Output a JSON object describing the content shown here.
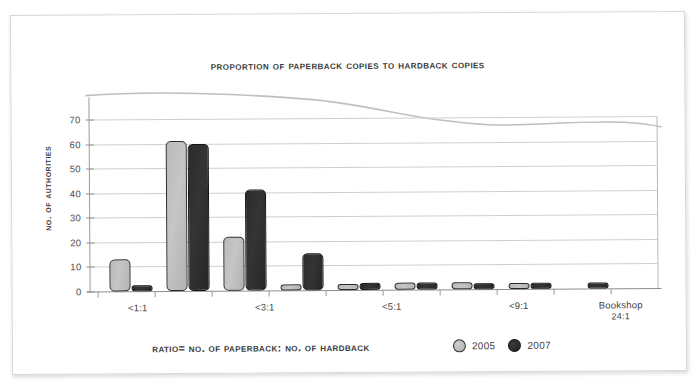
{
  "chart_data": {
    "type": "bar",
    "title": "Proportion of paperback copies to hardback copies",
    "xlabel": "Ratio= no. of paperback: no. of hardback",
    "ylabel": "No. of authorities",
    "categories": [
      "<1:1",
      "",
      "<3:1",
      "",
      "<5:1",
      "",
      "<9:1",
      "",
      "Bookshop 24:1"
    ],
    "tick_labels": [
      {
        "main": "<1:1",
        "sub": ""
      },
      {
        "main": "<3:1",
        "sub": ""
      },
      {
        "main": "<5:1",
        "sub": ""
      },
      {
        "main": "<9:1",
        "sub": ""
      },
      {
        "main": "Bookshop",
        "sub": "24:1"
      }
    ],
    "series": [
      {
        "name": "2005",
        "color": "#bdbdbd",
        "values": [
          13,
          61,
          22,
          2,
          1,
          3,
          3,
          2,
          0
        ]
      },
      {
        "name": "2007",
        "color": "#2e2e2e",
        "values": [
          1,
          60,
          41,
          15,
          3,
          3,
          2,
          2,
          1
        ]
      }
    ],
    "ylim": [
      0,
      70
    ],
    "yticks": [
      0,
      10,
      20,
      30,
      40,
      50,
      60,
      70
    ],
    "grid": true,
    "legend_position": "bottom-right",
    "legend": [
      "2005",
      "2007"
    ]
  },
  "axis": {
    "y_tick_0": "0",
    "y_tick_1": "10",
    "y_tick_2": "20",
    "y_tick_3": "30",
    "y_tick_4": "40",
    "y_tick_5": "50",
    "y_tick_6": "60",
    "y_tick_7": "70"
  },
  "legend": {
    "item_0_label": "2005",
    "item_1_label": "2007"
  },
  "xticks": {
    "t0_main": "<1:1",
    "t1_main": "<3:1",
    "t2_main": "<5:1",
    "t3_main": "<9:1",
    "t4_main": "Bookshop",
    "t4_sub": "24:1"
  }
}
